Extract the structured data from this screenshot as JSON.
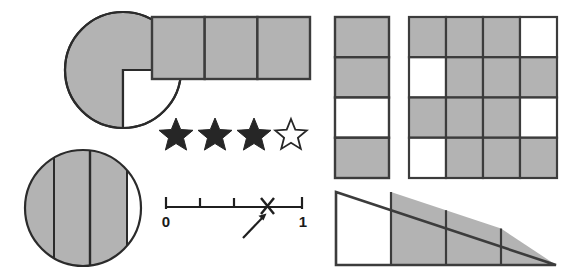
{
  "worksheet": {
    "title": "Fraction three quarters - multiple representations",
    "fraction_value": "3/4",
    "colors": {
      "shaded_fill": "#b3b3b3",
      "unshaded_fill": "#ffffff",
      "stroke": "#3c3c3c",
      "star_fill": "#262626",
      "background": "#ffffff"
    }
  },
  "figures": [
    {
      "id": "pie-three-quarters",
      "name": "pie-chart-three-quarters",
      "type": "pie",
      "total_parts": 4,
      "shaded_parts": 3,
      "unshaded_parts": 1,
      "cx": 123,
      "cy": 70,
      "r": 58,
      "unshaded_quadrant": "bottom-right"
    },
    {
      "id": "bar-three-cells",
      "name": "bar-model-three-cells",
      "type": "rectangle-strip",
      "total_parts": 3,
      "shaded_parts": 3,
      "unshaded_parts": 0,
      "x": 152,
      "y": 17,
      "width": 158,
      "height": 62,
      "cells": [
        "shaded",
        "shaded",
        "shaded"
      ]
    },
    {
      "id": "star-rating",
      "name": "star-rating-three-of-four",
      "type": "stars",
      "total_parts": 4,
      "shaded_parts": 3,
      "unshaded_parts": 1,
      "stars": [
        "filled",
        "filled",
        "filled",
        "outline"
      ],
      "cy": 134,
      "cx_list": [
        176,
        215,
        254,
        290
      ],
      "radius": 16
    },
    {
      "id": "number-line",
      "name": "number-line-three-quarters",
      "type": "number-line",
      "x_start": 166,
      "x_end": 302,
      "y": 207,
      "start_label": "0",
      "end_label": "1",
      "ticks": [
        0,
        0.25,
        0.5,
        0.75,
        1
      ],
      "marker": {
        "glyph": "x-marker",
        "position": 0.75
      },
      "arrow": {
        "from": [
          243,
          237
        ],
        "to": [
          264,
          214
        ]
      }
    },
    {
      "id": "column-four-cells",
      "name": "vertical-column-four-cells",
      "type": "column-strip",
      "total_parts": 4,
      "shaded_parts": 3,
      "unshaded_parts": 1,
      "x": 335,
      "y": 17,
      "width": 54,
      "height": 161,
      "cells": [
        "shaded",
        "shaded",
        "unshaded",
        "shaded"
      ]
    },
    {
      "id": "grid-four-by-four",
      "name": "grid-four-by-four",
      "type": "grid",
      "rows": 4,
      "cols": 4,
      "total_parts": 16,
      "shaded_parts": 12,
      "unshaded_parts": 4,
      "x": 409,
      "y": 17,
      "width": 148,
      "height": 161,
      "cells": [
        [
          "shaded",
          "shaded",
          "shaded",
          "unshaded"
        ],
        [
          "unshaded",
          "shaded",
          "shaded",
          "shaded"
        ],
        [
          "shaded",
          "shaded",
          "shaded",
          "unshaded"
        ],
        [
          "unshaded",
          "shaded",
          "shaded",
          "shaded"
        ]
      ]
    },
    {
      "id": "triangle-four-strips",
      "name": "triangle-four-strips",
      "type": "triangle",
      "total_parts": 4,
      "shaded_parts": 3,
      "unshaded_parts": 1,
      "apex": [
        336,
        192
      ],
      "base_left": [
        336,
        265
      ],
      "base_right": [
        556,
        265
      ],
      "strips": [
        "unshaded",
        "shaded",
        "shaded",
        "shaded"
      ]
    }
  ]
}
